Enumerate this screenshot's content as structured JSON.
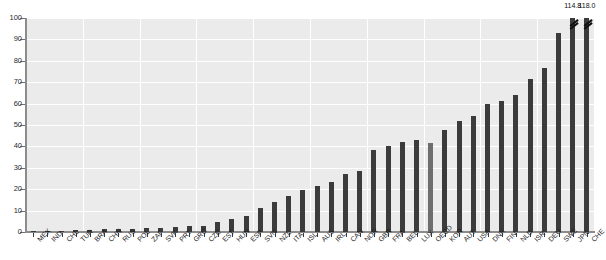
{
  "chart_data": {
    "type": "bar",
    "title": "",
    "subtitle": "",
    "xlabel": "",
    "ylabel": "",
    "ylim": [
      0,
      100
    ],
    "ytick_step": 10,
    "yticks": [
      0,
      10,
      20,
      30,
      40,
      50,
      60,
      70,
      80,
      90,
      100
    ],
    "grid": true,
    "legend": "none",
    "orientation": "vertical",
    "sorted": "ascending",
    "axis_broken": true,
    "note": "Last two bars exceed the 100 axis maximum and are drawn truncated with break marks; their values are printed above them.",
    "categories": [
      "MEX",
      "IND",
      "CHL",
      "TUR",
      "BRA",
      "CHN",
      "RUS",
      "POL",
      "ZAF",
      "SVK",
      "PRT",
      "GRC",
      "CZE",
      "EST",
      "HUN",
      "ESP",
      "SVN",
      "NZL",
      "ITA",
      "ISL",
      "AUS",
      "IRL",
      "CAN",
      "NOR",
      "GBR",
      "FRA",
      "BEL",
      "LUX",
      "OECD",
      "KOR",
      "AUT",
      "USA",
      "DNK",
      "FIN",
      "NLD",
      "ISR",
      "DEU",
      "SWE",
      "JPN",
      "CHE"
    ],
    "values": [
      0.3,
      0.5,
      0.7,
      0.8,
      1.0,
      1.2,
      1.4,
      1.6,
      1.8,
      2.0,
      2.3,
      2.6,
      3.0,
      4.5,
      6.0,
      7.5,
      11.0,
      14.0,
      17.0,
      19.5,
      21.5,
      23.5,
      27.0,
      28.5,
      38.5,
      40.0,
      42.0,
      43.0,
      41.5,
      47.5,
      52.0,
      54.0,
      60.0,
      61.0,
      64.0,
      71.5,
      76.5,
      93.0,
      114.8,
      118.0
    ],
    "displayed_values": {
      "JPN": "114.8",
      "CHE": "118.0"
    },
    "highlight_category": "OECD",
    "colors": {
      "bar": "#3b3b3b",
      "highlight_bar": "#6e6e6e",
      "plot_background": "#ebebeb",
      "gridline": "#ffffff",
      "axis": "#8c8c8c",
      "tick_label": "#2b2b2b",
      "page_background": "#ffffff"
    }
  }
}
